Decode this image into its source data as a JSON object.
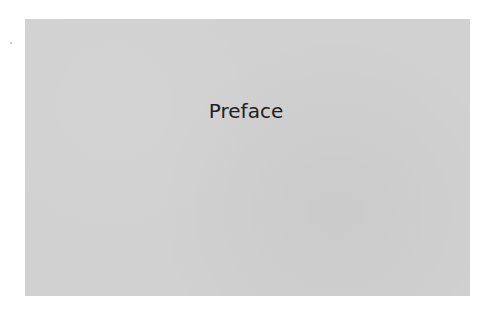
{
  "page": {
    "title": "Preface"
  },
  "colors": {
    "panel_background": "#d1d1d1",
    "page_background": "#ffffff",
    "text": "#1e1e1e"
  }
}
